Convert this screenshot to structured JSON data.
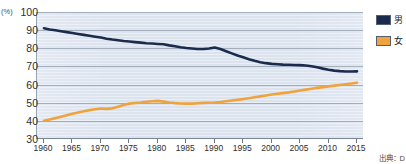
{
  "top_caption": "",
  "axis": {
    "y_unit": "(%)",
    "y_ticks": [
      100,
      90,
      80,
      70,
      60,
      50,
      40,
      30
    ],
    "x_ticks": [
      1960,
      1965,
      1970,
      1975,
      1980,
      1985,
      1990,
      1995,
      2000,
      2005,
      2010,
      2015
    ]
  },
  "legend": {
    "items": [
      {
        "label": "男",
        "color": "#1b2b4d"
      },
      {
        "label": "女",
        "color": "#f0a33c"
      }
    ]
  },
  "source_note": "出典：D",
  "chart_data": {
    "type": "line",
    "title": "",
    "xlabel": "",
    "ylabel": "(%)",
    "xlim": [
      1960,
      2015
    ],
    "ylim": [
      30,
      100
    ],
    "grid": true,
    "legend_position": "right",
    "x": [
      1960,
      1961,
      1962,
      1963,
      1964,
      1965,
      1966,
      1967,
      1968,
      1969,
      1970,
      1971,
      1972,
      1973,
      1974,
      1975,
      1976,
      1977,
      1978,
      1979,
      1980,
      1981,
      1982,
      1983,
      1984,
      1985,
      1986,
      1987,
      1988,
      1989,
      1990,
      1991,
      1992,
      1993,
      1994,
      1995,
      1996,
      1997,
      1998,
      1999,
      2000,
      2001,
      2002,
      2003,
      2004,
      2005,
      2006,
      2007,
      2008,
      2009,
      2010,
      2011,
      2012,
      2013,
      2014,
      2015
    ],
    "series": [
      {
        "name": "男",
        "color": "#1b2b4d",
        "values": [
          91.0,
          90.4,
          89.9,
          89.4,
          88.9,
          88.4,
          87.9,
          87.4,
          86.9,
          86.4,
          85.9,
          85.3,
          84.8,
          84.4,
          84.0,
          83.7,
          83.4,
          83.1,
          82.8,
          82.6,
          82.4,
          82.2,
          81.6,
          81.1,
          80.6,
          80.2,
          79.9,
          79.6,
          79.6,
          79.9,
          80.4,
          79.6,
          78.4,
          77.2,
          76.0,
          75.0,
          74.0,
          73.1,
          72.3,
          71.8,
          71.4,
          71.2,
          71.0,
          70.9,
          70.8,
          70.7,
          70.5,
          70.1,
          69.5,
          68.8,
          68.2,
          67.7,
          67.4,
          67.2,
          67.2,
          67.3
        ]
      },
      {
        "name": "女",
        "color": "#f0a33c",
        "values": [
          40.0,
          40.8,
          41.5,
          42.3,
          43.1,
          43.9,
          44.6,
          45.3,
          45.9,
          46.4,
          46.8,
          46.6,
          46.9,
          47.8,
          48.7,
          49.5,
          49.8,
          50.1,
          50.5,
          50.8,
          51.0,
          50.6,
          50.1,
          49.8,
          49.6,
          49.5,
          49.5,
          49.7,
          49.9,
          50.0,
          50.1,
          50.4,
          50.8,
          51.2,
          51.6,
          52.0,
          52.5,
          53.0,
          53.5,
          54.0,
          54.5,
          54.9,
          55.3,
          55.7,
          56.2,
          56.7,
          57.2,
          57.7,
          58.2,
          58.6,
          59.0,
          59.4,
          59.8,
          60.2,
          60.6,
          61.0
        ]
      }
    ]
  }
}
